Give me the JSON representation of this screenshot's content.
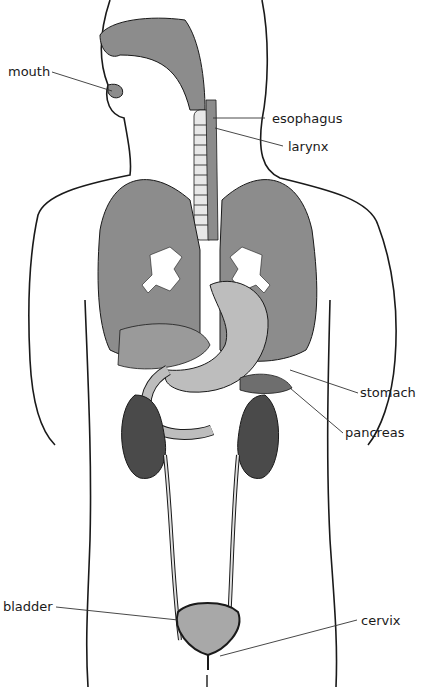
{
  "labels": {
    "mouth": "mouth",
    "esophagus": "esophagus",
    "larynx": "larynx",
    "stomach": "stomach",
    "pancreas": "pancreas",
    "bladder": "bladder",
    "cervix": "cervix"
  },
  "colors": {
    "organ_fill": "#8c8c8c",
    "organ_dark": "#4a4a4a",
    "organ_light": "#bdbdbd",
    "outline": "#1a1a1a",
    "leader": "#333333"
  }
}
